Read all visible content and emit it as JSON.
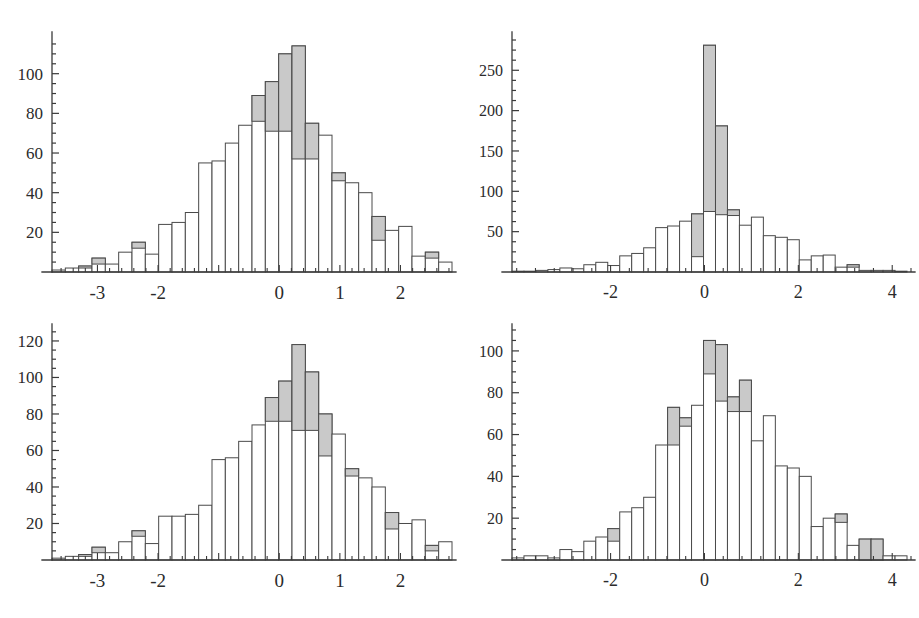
{
  "figure": {
    "title": "",
    "background_color": "#ffffff",
    "panel_count": 4,
    "layout": "2x2 grid of histograms"
  },
  "style": {
    "bar_fill": "#ffffff",
    "bar_shaded_fill": "#c9c9c9",
    "bar_edge": "#4a4a4a",
    "axis_color": "#3a3a3a",
    "label_color": "#2b2b2b"
  },
  "chart_data": [
    {
      "id": "top-left",
      "type": "bar",
      "title": "",
      "xlabel": "",
      "ylabel": "",
      "grid": false,
      "legend": "none",
      "xlim": [
        -3.75,
        2.85
      ],
      "ylim": [
        0,
        118
      ],
      "xticks": [
        -3,
        -2,
        -1,
        0,
        1,
        2
      ],
      "xtick_labels": [
        "-3",
        "-2",
        "",
        "0",
        "1",
        "2"
      ],
      "yticks": [
        20,
        40,
        60,
        80,
        100
      ],
      "ytick_labels": [
        "20",
        "40",
        "60",
        "80",
        "100"
      ],
      "bin_width": 0.22,
      "bin_starts": [
        -3.75,
        -3.53,
        -3.31,
        -3.09,
        -2.87,
        -2.65,
        -2.43,
        -2.21,
        -1.99,
        -1.77,
        -1.55,
        -1.33,
        -1.11,
        -0.89,
        -0.67,
        -0.45,
        -0.23,
        -0.01,
        0.21,
        0.43,
        0.65,
        0.87,
        1.09,
        1.31,
        1.53,
        1.75,
        1.97,
        2.19,
        2.41,
        2.63
      ],
      "values": [
        1,
        2,
        3,
        7,
        4,
        10,
        15,
        9,
        24,
        25,
        30,
        55,
        56,
        65,
        74,
        89,
        96,
        110,
        114,
        75,
        69,
        50,
        45,
        40,
        28,
        21,
        23,
        8,
        10,
        5
      ],
      "shaded_values": [
        0,
        0,
        1,
        3,
        0,
        0,
        3,
        0,
        0,
        0,
        0,
        0,
        0,
        0,
        0,
        13,
        25,
        39,
        57,
        18,
        0,
        4,
        0,
        0,
        12,
        0,
        0,
        0,
        3,
        0
      ]
    },
    {
      "id": "top-right",
      "type": "bar",
      "title": "",
      "xlabel": "",
      "ylabel": "",
      "grid": false,
      "legend": "none",
      "xlim": [
        -4.1,
        4.4
      ],
      "ylim": [
        0,
        290
      ],
      "xticks": [
        -2,
        0,
        2,
        4
      ],
      "xtick_labels": [
        "-2",
        "0",
        "2",
        "4"
      ],
      "yticks": [
        50,
        100,
        150,
        200,
        250
      ],
      "ytick_labels": [
        "50",
        "100",
        "150",
        "200",
        "250"
      ],
      "bin_width": 0.255,
      "bin_starts": [
        -4.1,
        -3.845,
        -3.59,
        -3.335,
        -3.08,
        -2.825,
        -2.57,
        -2.315,
        -2.06,
        -1.805,
        -1.55,
        -1.295,
        -1.04,
        -0.785,
        -0.53,
        -0.275,
        -0.02,
        0.235,
        0.49,
        0.745,
        1.0,
        1.255,
        1.51,
        1.765,
        2.02,
        2.275,
        2.53,
        2.785,
        3.04,
        3.295,
        3.55,
        3.805,
        4.06
      ],
      "values": [
        1,
        1,
        2,
        3,
        5,
        4,
        9,
        12,
        8,
        20,
        23,
        30,
        55,
        57,
        63,
        72,
        281,
        181,
        77,
        58,
        68,
        45,
        43,
        40,
        15,
        20,
        21,
        6,
        9,
        2,
        2,
        2,
        1
      ],
      "shaded_values": [
        0,
        0,
        0,
        0,
        0,
        0,
        0,
        0,
        0,
        0,
        0,
        0,
        0,
        0,
        0,
        53,
        206,
        110,
        7,
        0,
        0,
        0,
        0,
        0,
        0,
        0,
        0,
        0,
        3,
        0,
        0,
        0,
        0
      ]
    },
    {
      "id": "bottom-left",
      "type": "bar",
      "title": "",
      "xlabel": "",
      "ylabel": "",
      "grid": false,
      "legend": "none",
      "xlim": [
        -3.75,
        2.85
      ],
      "ylim": [
        0,
        126
      ],
      "xticks": [
        -3,
        -2,
        -1,
        0,
        1,
        2
      ],
      "xtick_labels": [
        "-3",
        "-2",
        "",
        "0",
        "1",
        "2"
      ],
      "yticks": [
        20,
        40,
        60,
        80,
        100,
        120
      ],
      "ytick_labels": [
        "20",
        "40",
        "60",
        "80",
        "100",
        "120"
      ],
      "bin_width": 0.22,
      "bin_starts": [
        -3.75,
        -3.53,
        -3.31,
        -3.09,
        -2.87,
        -2.65,
        -2.43,
        -2.21,
        -1.99,
        -1.77,
        -1.55,
        -1.33,
        -1.11,
        -0.89,
        -0.67,
        -0.45,
        -0.23,
        -0.01,
        0.21,
        0.43,
        0.65,
        0.87,
        1.09,
        1.31,
        1.53,
        1.75,
        1.97,
        2.19,
        2.41,
        2.63
      ],
      "values": [
        1,
        2,
        3,
        7,
        4,
        10,
        16,
        9,
        24,
        24,
        25,
        30,
        55,
        56,
        65,
        74,
        89,
        98,
        118,
        103,
        80,
        69,
        50,
        45,
        40,
        26,
        20,
        22,
        8,
        10
      ],
      "shaded_values": [
        0,
        0,
        1,
        3,
        0,
        0,
        3,
        0,
        0,
        0,
        0,
        0,
        0,
        0,
        0,
        0,
        13,
        22,
        47,
        32,
        23,
        0,
        4,
        0,
        0,
        9,
        0,
        0,
        3,
        0
      ]
    },
    {
      "id": "bottom-right",
      "type": "bar",
      "title": "",
      "xlabel": "",
      "ylabel": "",
      "grid": false,
      "legend": "none",
      "xlim": [
        -4.1,
        4.4
      ],
      "ylim": [
        0,
        110
      ],
      "xticks": [
        -2,
        0,
        2,
        4
      ],
      "xtick_labels": [
        "-2",
        "0",
        "2",
        "4"
      ],
      "yticks": [
        20,
        40,
        60,
        80,
        100
      ],
      "ytick_labels": [
        "20",
        "40",
        "60",
        "80",
        "100"
      ],
      "bin_width": 0.255,
      "bin_starts": [
        -4.1,
        -3.845,
        -3.59,
        -3.335,
        -3.08,
        -2.825,
        -2.57,
        -2.315,
        -2.06,
        -1.805,
        -1.55,
        -1.295,
        -1.04,
        -0.785,
        -0.53,
        -0.275,
        -0.02,
        0.235,
        0.49,
        0.745,
        1.0,
        1.255,
        1.51,
        1.765,
        2.02,
        2.275,
        2.53,
        2.785,
        3.04,
        3.295,
        3.55,
        3.805,
        4.06
      ],
      "values": [
        1,
        2,
        2,
        1,
        5,
        4,
        9,
        11,
        15,
        23,
        25,
        30,
        55,
        73,
        68,
        74,
        105,
        103,
        78,
        86,
        57,
        69,
        45,
        44,
        40,
        16,
        20,
        22,
        7,
        10,
        10,
        2,
        2
      ],
      "shaded_values": [
        0,
        0,
        0,
        0,
        0,
        0,
        0,
        0,
        6,
        0,
        0,
        0,
        0,
        18,
        4,
        0,
        16,
        27,
        7,
        15,
        0,
        0,
        0,
        0,
        0,
        0,
        0,
        4,
        0,
        10,
        10,
        0,
        0
      ]
    }
  ]
}
